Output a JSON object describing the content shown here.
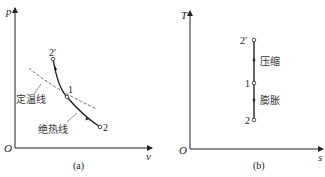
{
  "panel_a": {
    "y_axis_label": "p",
    "x_axis_label": "v",
    "origin_label": "O",
    "caption": "(a)",
    "points": {
      "p2prime": "2′",
      "p1": "1",
      "p2": "2"
    },
    "isotherm_label": "定温线",
    "adiabat_label": "绝热线",
    "colors": {
      "line": "#222222",
      "dashed": "#444444"
    }
  },
  "panel_b": {
    "y_axis_label": "T",
    "x_axis_label": "s",
    "origin_label": "O",
    "caption": "(b)",
    "points": {
      "p2prime": "2′",
      "p1": "1",
      "p2": "2"
    },
    "compression_label": "压缩",
    "expansion_label": "膨胀"
  }
}
